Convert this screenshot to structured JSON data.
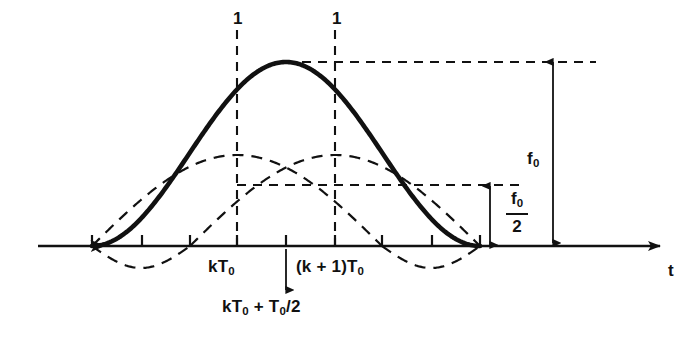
{
  "figure": {
    "background_color": "#ffffff",
    "ink_color": "#111111",
    "width": 694,
    "height": 342
  },
  "axis": {
    "name": "time-axis",
    "label": "t",
    "label_x": 668,
    "label_y": 262,
    "baseline_y": 246,
    "x_start": 38,
    "x_end": 660,
    "arrow": true,
    "ticks": [
      {
        "x": 92,
        "dir": "up"
      },
      {
        "x": 142,
        "dir": "up"
      },
      {
        "x": 190,
        "dir": "up"
      },
      {
        "x": 237,
        "dir": "up"
      },
      {
        "x": 286,
        "dir": "up"
      },
      {
        "x": 335,
        "dir": "up"
      },
      {
        "x": 382,
        "dir": "up"
      },
      {
        "x": 432,
        "dir": "up"
      },
      {
        "x": 480,
        "dir": "up"
      }
    ],
    "tick_length": 11
  },
  "labels": {
    "ones": [
      {
        "text": "1",
        "x": 233,
        "y": 10
      },
      {
        "text": "1",
        "x": 332,
        "y": 10
      }
    ],
    "kT0": {
      "text": "kT",
      "sub": "0",
      "x": 208,
      "y": 258
    },
    "kT0_plus_half": {
      "text": "kT",
      "sub": "0",
      "text2": " + T",
      "sub2": "0",
      "text3": "/2",
      "x": 222,
      "y": 298
    },
    "k_plus_1_T0": {
      "text": "(k + 1)T",
      "sub": "0",
      "x": 296,
      "y": 258
    },
    "f0": {
      "text": "f",
      "sub": "0",
      "x": 527,
      "y": 150
    },
    "f0_over_2": {
      "num": "f",
      "num_sub": "0",
      "den": "2",
      "x": 506,
      "y": 190
    }
  },
  "solid_curve": {
    "name": "composite-pulse",
    "description": "Bold raised-cosine composite waveform spanning kT0-T0 to (k+1)T0+T0",
    "stroke_width": 4.6,
    "x_left": 92,
    "x_right": 480,
    "peak_x": 286,
    "peak_y": 62,
    "baseline_y": 246
  },
  "dashed_curves": [
    {
      "name": "half-cycle-sine-left",
      "peak_x": 237,
      "peak_y": 155,
      "zero_left": 92,
      "zero_right": 382,
      "negative_lobe": {
        "from": 92,
        "to": 190,
        "depth": 22
      }
    },
    {
      "name": "half-cycle-sine-right",
      "peak_x": 335,
      "peak_y": 155,
      "zero_left": 190,
      "zero_right": 480,
      "negative_lobe": {
        "from": 382,
        "to": 480,
        "depth": 22
      }
    }
  ],
  "dashed_guides": {
    "verticals": [
      {
        "name": "guide-vertical-kT0",
        "x": 237,
        "y_top": 30,
        "y_bottom": 246
      },
      {
        "name": "guide-vertical-k-plus-1-T0",
        "x": 335,
        "y_top": 30,
        "y_bottom": 246
      }
    ],
    "horizontals": [
      {
        "name": "guide-horizontal-peak",
        "y": 62,
        "x_left": 286,
        "x_right": 596
      },
      {
        "name": "guide-horizontal-half",
        "y": 185,
        "x_left": 286,
        "x_right": 520
      },
      {
        "name": "guide-horizontal-half-left",
        "y": 185,
        "x_left": 237,
        "x_right": 286
      }
    ]
  },
  "dimension_arrows": [
    {
      "name": "f0-dimension-arrow",
      "x": 553,
      "y_top": 62,
      "y_bottom": 243,
      "double_headed": true
    },
    {
      "name": "f0-over-2-dimension-arrow",
      "x": 490,
      "y_top": 186,
      "y_bottom": 245,
      "double_headed": true
    },
    {
      "name": "kT0-plus-half-pointer-arrow",
      "x": 286,
      "y_top": 290,
      "y_bottom": 249,
      "double_headed": false
    }
  ],
  "stroke_styles": {
    "dash_pattern": "9 7",
    "dash_pattern_fine": "7 6",
    "thin_width": 1.8,
    "dash_width": 2.1
  }
}
